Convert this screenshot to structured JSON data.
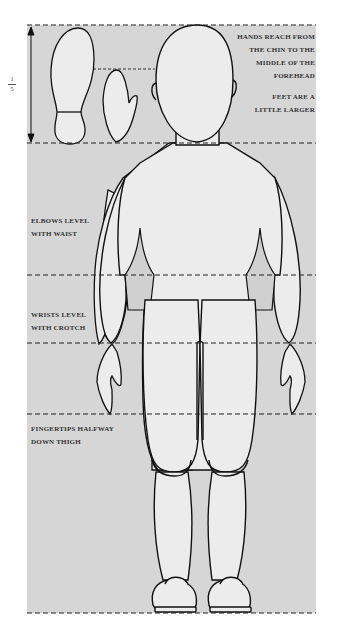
{
  "diagram": {
    "fraction": {
      "numerator": "1",
      "denominator": "5"
    },
    "annotations": {
      "head_note": [
        "HANDS REACH FROM",
        "THE CHIN TO THE",
        "MIDDLE OF THE",
        "FOREHEAD"
      ],
      "feet_note": [
        "FEET ARE A",
        "LITTLE LARGER"
      ],
      "elbows": [
        "ELBOWS LEVEL",
        "WITH WAIST"
      ],
      "wrists": [
        "WRISTS LEVEL",
        "WITH CROTCH"
      ],
      "fingertips": [
        "FINGERTIPS HALFWAY",
        "DOWN THIGH"
      ]
    },
    "guide_lines_y": [
      25,
      143,
      275,
      343,
      414,
      613
    ],
    "colors": {
      "background": "#ffffff",
      "panel": "#d6d6d6",
      "figure_fill": "#ececec",
      "limb_shade": "#d0d0d0",
      "stroke": "#111111",
      "text": "#333333"
    }
  }
}
